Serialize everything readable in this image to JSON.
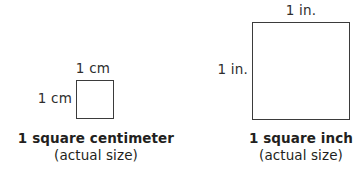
{
  "background_color": "#ffffff",
  "line_color": "#3b3b3b",
  "text_color": "#231f20",
  "figures": [
    {
      "id": "square-centimeter",
      "top_label": "1 cm",
      "side_label": "1 cm",
      "caption_title": "1 square centimeter",
      "caption_subtitle": "(actual size)",
      "square_size_px": 38
    },
    {
      "id": "square-inch",
      "top_label": "1 in.",
      "side_label": "1 in.",
      "caption_title": "1 square inch",
      "caption_subtitle": "(actual size)",
      "square_size_px": 98
    }
  ]
}
